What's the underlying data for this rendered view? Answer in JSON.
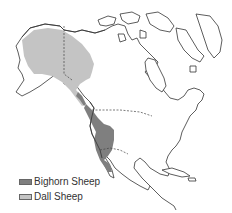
{
  "map": {
    "region": "North America",
    "colors": {
      "bighorn": "#7f7f7f",
      "dall": "#c4c4c4",
      "land": "#ffffff",
      "coastline": "#333333"
    }
  },
  "legend": {
    "items": [
      {
        "label": "Bighorn Sheep",
        "color": "#7f7f7f"
      },
      {
        "label": "Dall Sheep",
        "color": "#c4c4c4"
      }
    ]
  }
}
